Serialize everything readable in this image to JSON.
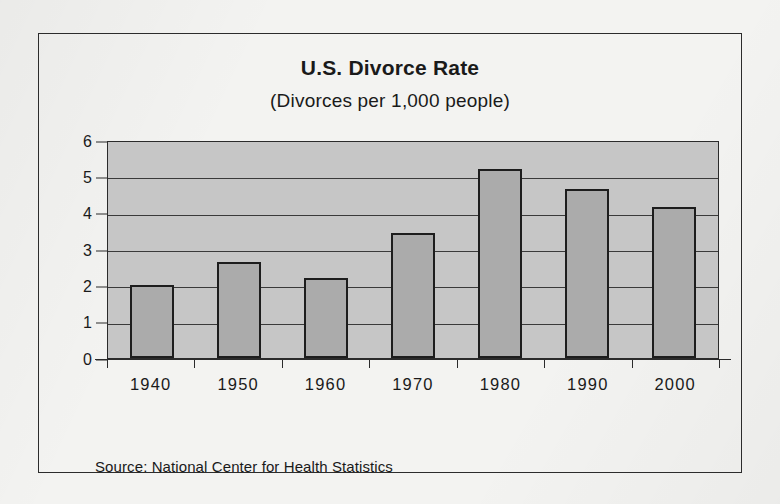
{
  "chart_data": {
    "type": "bar",
    "title": "U.S. Divorce Rate",
    "subtitle": "(Divorces per 1,000 people)",
    "xlabel": "",
    "ylabel": "",
    "categories": [
      "1940",
      "1950",
      "1960",
      "1970",
      "1980",
      "1990",
      "2000"
    ],
    "values": [
      2.0,
      2.65,
      2.2,
      3.45,
      5.2,
      4.65,
      4.15
    ],
    "ylim": [
      0,
      6
    ],
    "ytick_labels": [
      "0",
      "1",
      "2",
      "3",
      "4",
      "5",
      "6"
    ],
    "ytick_values": [
      0,
      1,
      2,
      3,
      4,
      5,
      6
    ],
    "grid": true,
    "legend": false,
    "source": "Source: National Center for Health Statistics",
    "colors": {
      "bar_fill": "#ababab",
      "bar_edge": "#1d1d1d",
      "plot_background": "#c6c6c6",
      "gridline": "#3a3a3a",
      "page_background": "#f3f3f1",
      "frame_border": "#2c2c2c",
      "text": "#1a1a1a"
    }
  }
}
